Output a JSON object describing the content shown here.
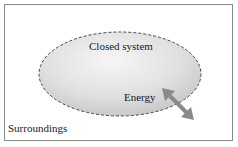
{
  "diagram": {
    "system_label": "Closed system",
    "energy_label": "Energy",
    "surroundings_label": "Surroundings",
    "colors": {
      "frame": "#8a8a8a",
      "ellipse_fill_light": "#f4f4f4",
      "ellipse_fill_dark": "#c9c9c9",
      "ellipse_border": "#444444",
      "arrow": "#8a8a8a",
      "text": "#1a1a1a"
    }
  }
}
